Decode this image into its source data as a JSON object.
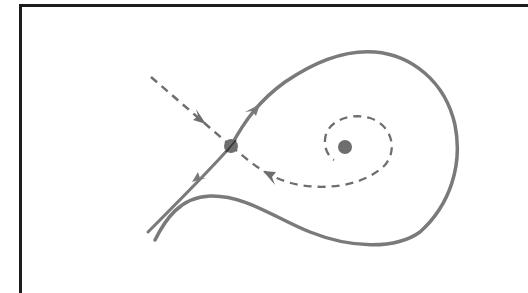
{
  "diagram": {
    "type": "phase-portrait",
    "colors": {
      "frame": "#1c1c1c",
      "curve": "#7a7a7a",
      "point": "#6e6e6e",
      "background": "#ffffff"
    },
    "elements": [
      {
        "id": "saddle-point",
        "kind": "point",
        "x": 231,
        "y": 146
      },
      {
        "id": "focus-point",
        "kind": "point",
        "x": 345,
        "y": 147
      },
      {
        "id": "stable-manifold-incoming",
        "kind": "dashed-curve",
        "arrow": "toward saddle"
      },
      {
        "id": "stable-manifold-spiral",
        "kind": "dashed-curve",
        "arrow": "toward saddle"
      },
      {
        "id": "unstable-manifold-loop",
        "kind": "solid-curve",
        "arrow": "away from saddle"
      },
      {
        "id": "unstable-manifold-outgoing",
        "kind": "solid-curve",
        "arrow": "away from saddle"
      }
    ]
  }
}
